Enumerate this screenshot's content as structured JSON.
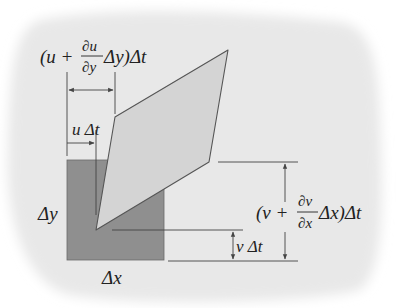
{
  "diagram": {
    "type": "fluid element deformation",
    "colors": {
      "background_blob": "#e9e9e9",
      "original_element": "#8f8f8f",
      "deformed_element": "#d4d4d4",
      "lines": "#444444",
      "text": "#222222"
    },
    "labels": {
      "top_dimension": {
        "open": "(u + ",
        "frac_num": "∂u",
        "frac_den": "∂y",
        "close": " Δy)Δt"
      },
      "u_dt": "u Δt",
      "delta_y": "Δy",
      "delta_x": "Δx",
      "v_dt": "v Δt",
      "right_dimension": {
        "open": "(v + ",
        "frac_num": "∂v",
        "frac_den": "∂x",
        "close": "Δx)Δt"
      }
    }
  }
}
